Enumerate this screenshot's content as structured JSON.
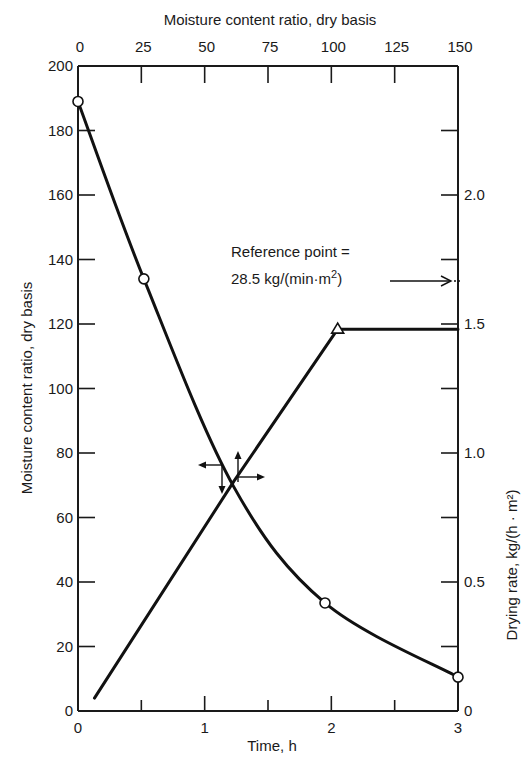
{
  "chart_data": {
    "type": "line",
    "title": "",
    "xlabel": "Time, h",
    "ylabel": "Moisture content ratio, dry basis",
    "y2label": "Drying rate, kg/(h · m²)",
    "x2label": "Moisture content ratio, dry basis",
    "xlim": [
      0,
      3
    ],
    "ylim": [
      0,
      200
    ],
    "y2lim": [
      0,
      2.5
    ],
    "x2lim": [
      0,
      150
    ],
    "grid": false,
    "x_ticks": [
      "0",
      "1",
      "2",
      "3"
    ],
    "y_ticks": [
      "0",
      "20",
      "40",
      "60",
      "80",
      "100",
      "120",
      "140",
      "160",
      "180",
      "200"
    ],
    "y2_ticks": [
      "0",
      "0.5",
      "1.0",
      "1.5",
      "2.0"
    ],
    "x2_ticks": [
      "0",
      "25",
      "50",
      "75",
      "100",
      "125",
      "150"
    ],
    "series": [
      {
        "name": "Moisture content ratio vs time",
        "axis": "left",
        "marker": "circle",
        "x": [
          0,
          0.52,
          1.23,
          1.95,
          3.0
        ],
        "values": [
          189,
          134,
          69.5,
          33.5,
          10.5
        ],
        "marked_points": [
          [
            0,
            189
          ],
          [
            0.52,
            134
          ],
          [
            1.95,
            33.5
          ],
          [
            3.0,
            10.5
          ]
        ]
      },
      {
        "name": "Drying rate vs moisture content",
        "axis": "right",
        "marker": "triangle",
        "x": [
          0.13,
          1.23,
          2.05,
          3.0
        ],
        "values": [
          0.05,
          0.89,
          1.48,
          1.48
        ],
        "marked_points": [
          [
            2.05,
            1.48
          ]
        ]
      }
    ],
    "annotations": [
      {
        "text": "Reference point =",
        "line2": "28.5 kg/(min·m²)",
        "points_to": {
          "axis": "right",
          "value": 1.67
        }
      },
      {
        "text": "crossing arrows",
        "at": [
          1.23,
          69.5
        ]
      }
    ]
  },
  "labels": {
    "top_title": "Moisture content ratio, dry basis",
    "bottom_title": "Time, h",
    "left_title": "Moisture content ratio, dry basis",
    "right_title": "Drying rate, kg/(h · m²)",
    "ref_line1": "Reference point =",
    "ref_line2": "28.5 kg/(min·m²)"
  }
}
